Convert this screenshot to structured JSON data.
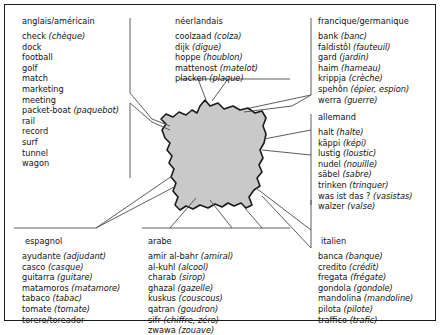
{
  "figure": {
    "map_region_name": "France",
    "map_fill_color": "#c9c9c9",
    "map_stroke_color": "#1a1a1a",
    "frame_color": "#1a1a1a",
    "background_color": "#ffffff",
    "text_color": "#111111"
  },
  "blocks": {
    "anglais": {
      "title": "anglais/américain",
      "entries": [
        {
          "word": "check",
          "gloss": "(chèque)"
        },
        {
          "word": "dock",
          "gloss": ""
        },
        {
          "word": "football",
          "gloss": ""
        },
        {
          "word": "golf",
          "gloss": ""
        },
        {
          "word": "match",
          "gloss": ""
        },
        {
          "word": "marketing",
          "gloss": ""
        },
        {
          "word": "meeting",
          "gloss": ""
        },
        {
          "word": "packet-boat",
          "gloss": "(paquebot)"
        },
        {
          "word": "rail",
          "gloss": ""
        },
        {
          "word": "record",
          "gloss": ""
        },
        {
          "word": "surf",
          "gloss": ""
        },
        {
          "word": "tunnel",
          "gloss": ""
        },
        {
          "word": "wagon",
          "gloss": ""
        }
      ]
    },
    "neerlandais": {
      "title": "néerlandais",
      "entries": [
        {
          "word": "coolzaad",
          "gloss": "(colza)"
        },
        {
          "word": "dijk",
          "gloss": "(digue)"
        },
        {
          "word": "hoppe",
          "gloss": "(houblon)"
        },
        {
          "word": "mattenost",
          "gloss": "(matelot)"
        },
        {
          "word": "placken",
          "gloss": "(plaque)"
        }
      ]
    },
    "francique": {
      "title": "francique/germanique",
      "entries": [
        {
          "word": "bank",
          "gloss": "(banc)"
        },
        {
          "word": "faldistôl",
          "gloss": "(fauteuil)"
        },
        {
          "word": "gard",
          "gloss": "(jardin)"
        },
        {
          "word": "haim",
          "gloss": "(hameau)"
        },
        {
          "word": "krippja",
          "gloss": "(crèche)"
        },
        {
          "word": "spehôn",
          "gloss": "(épier, espion)"
        },
        {
          "word": "werra",
          "gloss": "(guerre)"
        }
      ]
    },
    "allemand": {
      "title": "allemand",
      "entries": [
        {
          "word": "halt",
          "gloss": "(halte)"
        },
        {
          "word": "käppi",
          "gloss": "(képi)"
        },
        {
          "word": "lustig",
          "gloss": "(loustic)"
        },
        {
          "word": "nudel",
          "gloss": "(nouille)"
        },
        {
          "word": "säbel",
          "gloss": "(sabre)"
        },
        {
          "word": "trinken",
          "gloss": "(trinquer)"
        },
        {
          "word": "was ist das ?",
          "gloss": "(vasistas)"
        },
        {
          "word": "walzer",
          "gloss": "(valse)"
        }
      ]
    },
    "espagnol": {
      "title": "espagnol",
      "entries": [
        {
          "word": "ayudante",
          "gloss": "(adjudant)"
        },
        {
          "word": "casco",
          "gloss": "(casque)"
        },
        {
          "word": "guitarra",
          "gloss": "(guitare)"
        },
        {
          "word": "matamoros",
          "gloss": "(matamore)"
        },
        {
          "word": "tabaco",
          "gloss": "(tabac)"
        },
        {
          "word": "tomate",
          "gloss": "(tomate)"
        },
        {
          "word": "torero/toreador",
          "gloss": ""
        }
      ]
    },
    "arabe": {
      "title": "arabe",
      "entries": [
        {
          "word": "amir al-bahr",
          "gloss": "(amiral)"
        },
        {
          "word": "al-kuhl",
          "gloss": "(alcool)"
        },
        {
          "word": "charab",
          "gloss": "(sirop)"
        },
        {
          "word": "ghazal",
          "gloss": "(gazelle)"
        },
        {
          "word": "kuskus",
          "gloss": "(couscous)"
        },
        {
          "word": "qatran",
          "gloss": "(goudron)"
        },
        {
          "word": "sifr",
          "gloss": "(chiffre, zéro)"
        },
        {
          "word": "zwawa",
          "gloss": "(zouave)"
        }
      ]
    },
    "italien": {
      "title": "italien",
      "entries": [
        {
          "word": "banca",
          "gloss": "(banque)"
        },
        {
          "word": "credito",
          "gloss": "(crédit)"
        },
        {
          "word": "fregata",
          "gloss": "(frégate)"
        },
        {
          "word": "gondola",
          "gloss": "(gondole)"
        },
        {
          "word": "mandolina",
          "gloss": "(mandoline)"
        },
        {
          "word": "pilota",
          "gloss": "(pilote)"
        },
        {
          "word": "traffico",
          "gloss": "(trafic)"
        }
      ]
    }
  }
}
